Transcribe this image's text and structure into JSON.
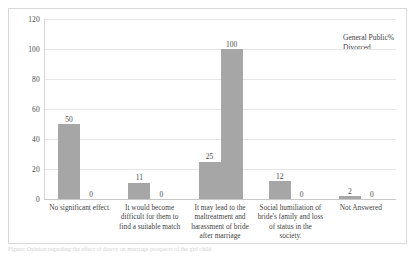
{
  "chart_data": {
    "type": "bar",
    "title": "",
    "xlabel": "",
    "ylabel": "",
    "ylim": [
      0,
      120
    ],
    "yticks": [
      0,
      20,
      40,
      60,
      80,
      100,
      120
    ],
    "grid": true,
    "legend_position": "top-right",
    "categories": [
      "No significant effect",
      "It would become difficult for them to find a suitable match",
      "It may lead to the maltreatment and harassment of bride after marriage",
      "Social humiliation of bride's family and loss of status in the society.",
      "Not Answered"
    ],
    "series": [
      {
        "name": "General Public%",
        "color": "#a6a6a6",
        "values": [
          50,
          11,
          25,
          12,
          2
        ]
      },
      {
        "name": "Divorced",
        "color": "#a6a6a6",
        "values": [
          0,
          0,
          100,
          0,
          0
        ]
      }
    ]
  },
  "yaxis": {
    "ticks": [
      "0",
      "20",
      "40",
      "60",
      "80",
      "100",
      "120"
    ]
  },
  "legend": {
    "entries": [
      {
        "label": "General Public%"
      },
      {
        "label": "Divorced"
      }
    ]
  },
  "caption": {
    "text": "Figure: Opinion regarding the effect of dowry on marriage prospects of the girl child"
  },
  "colors": {
    "bar": "#a6a6a6",
    "grid": "#e6e6e6",
    "frame": "#d9d9d9",
    "text": "#3c3c3c"
  }
}
